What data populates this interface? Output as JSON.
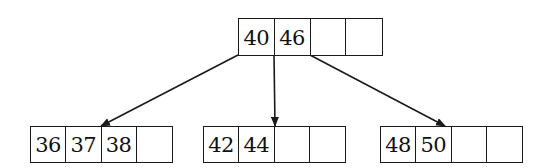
{
  "diagram": {
    "type": "b-tree",
    "root": {
      "keys": [
        "40",
        "46",
        "",
        ""
      ],
      "box": {
        "x": 238,
        "y": 18,
        "w": 143,
        "h": 37
      }
    },
    "children": [
      {
        "keys": [
          "36",
          "37",
          "38",
          ""
        ],
        "box": {
          "x": 30,
          "y": 126,
          "w": 143,
          "h": 37
        }
      },
      {
        "keys": [
          "42",
          "44",
          "",
          ""
        ],
        "box": {
          "x": 203,
          "y": 126,
          "w": 143,
          "h": 37
        }
      },
      {
        "keys": [
          "48",
          "50",
          "",
          ""
        ],
        "box": {
          "x": 380,
          "y": 126,
          "w": 143,
          "h": 37
        }
      }
    ],
    "edges": [
      {
        "from": "root.pointer0",
        "to": "child0",
        "x1": 238,
        "y1": 55,
        "x2": 101,
        "y2": 126
      },
      {
        "from": "root.pointer1",
        "to": "child1",
        "x1": 274,
        "y1": 55,
        "x2": 275,
        "y2": 126
      },
      {
        "from": "root.pointer2",
        "to": "child2",
        "x1": 310,
        "y1": 55,
        "x2": 445,
        "y2": 126
      }
    ],
    "line_color": "#1a1a1a"
  }
}
